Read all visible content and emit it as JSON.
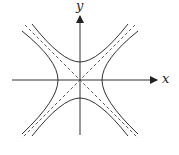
{
  "diagram": {
    "title": "",
    "x_axis_label": "x",
    "y_axis_label": "y",
    "elements": [
      "hyperbola x^2/a^2 - y^2/b^2 = 1 (left/right branches)",
      "conjugate hyperbola y^2/b^2 - x^2/a^2 = 1 (upper/lower branches)",
      "two dashed asymptotes y = ±(b/a)x"
    ],
    "colors": {
      "stroke": "#333333",
      "background": "#ffffff"
    }
  }
}
